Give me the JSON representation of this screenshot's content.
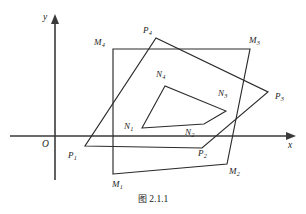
{
  "figure": {
    "caption_label": "图",
    "caption_number": "2.1.1",
    "axes": {
      "x_label": "x",
      "y_label": "y",
      "origin_label": "O",
      "x_axis_y": 136,
      "y_axis_x": 55,
      "x_axis_start": 10,
      "x_axis_end": 296,
      "y_axis_top": 14,
      "y_axis_bottom": 180
    },
    "polygons": [
      {
        "name": "quadrilateral-M",
        "closed": true,
        "vertices": [
          {
            "label": "M1",
            "x": 113,
            "y": 174
          },
          {
            "label": "M2",
            "x": 227,
            "y": 164
          },
          {
            "label": "M3",
            "x": 250,
            "y": 49
          },
          {
            "label": "M4",
            "x": 113,
            "y": 49
          }
        ]
      },
      {
        "name": "quadrilateral-P",
        "closed": true,
        "vertices": [
          {
            "label": "P1",
            "x": 85,
            "y": 146
          },
          {
            "label": "P2",
            "x": 202,
            "y": 148
          },
          {
            "label": "P3",
            "x": 268,
            "y": 92
          },
          {
            "label": "P4",
            "x": 156,
            "y": 38
          }
        ]
      },
      {
        "name": "quadrilateral-N",
        "closed": true,
        "vertices": [
          {
            "label": "N1",
            "x": 142,
            "y": 128
          },
          {
            "label": "N2",
            "x": 204,
            "y": 124
          },
          {
            "label": "N3",
            "x": 226,
            "y": 111
          },
          {
            "label": "N4",
            "x": 165,
            "y": 86
          }
        ]
      }
    ],
    "vertex_labels": [
      {
        "name": "vertex-label-M1",
        "base": "M",
        "sub": "1",
        "x": 112,
        "y": 180
      },
      {
        "name": "vertex-label-M2",
        "base": "M",
        "sub": "2",
        "x": 229,
        "y": 167
      },
      {
        "name": "vertex-label-M3",
        "base": "M",
        "sub": "3",
        "x": 249,
        "y": 36
      },
      {
        "name": "vertex-label-M4",
        "base": "M",
        "sub": "4",
        "x": 94,
        "y": 38
      },
      {
        "name": "vertex-label-P1",
        "base": "P",
        "sub": "1",
        "x": 68,
        "y": 151
      },
      {
        "name": "vertex-label-P2",
        "base": "P",
        "sub": "2",
        "x": 198,
        "y": 149
      },
      {
        "name": "vertex-label-P3",
        "base": "P",
        "sub": "3",
        "x": 275,
        "y": 92
      },
      {
        "name": "vertex-label-P4",
        "base": "P",
        "sub": "4",
        "x": 143,
        "y": 26
      },
      {
        "name": "vertex-label-N1",
        "base": "N",
        "sub": "1",
        "x": 124,
        "y": 122
      },
      {
        "name": "vertex-label-N2",
        "base": "N",
        "sub": "2",
        "x": 185,
        "y": 128
      },
      {
        "name": "vertex-label-N3",
        "base": "N",
        "sub": "3",
        "x": 218,
        "y": 89
      },
      {
        "name": "vertex-label-N4",
        "base": "N",
        "sub": "4",
        "x": 156,
        "y": 70
      }
    ],
    "colors": {
      "stroke": "#2a2a2a",
      "axis": "#3a3a3a",
      "background": "#ffffff",
      "text": "#1d1d1d"
    }
  }
}
